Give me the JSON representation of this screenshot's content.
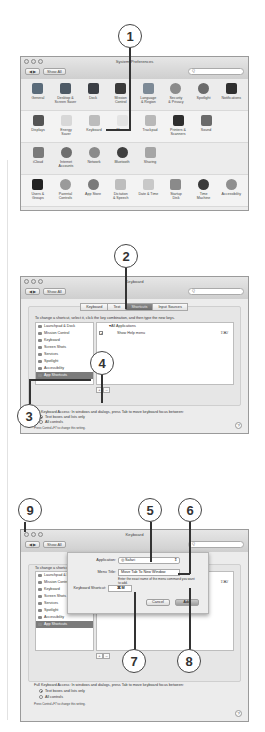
{
  "callouts": [
    "1",
    "2",
    "3",
    "4",
    "5",
    "6",
    "7",
    "8",
    "9"
  ],
  "system_prefs": {
    "title": "System Preferences",
    "show_all": "Show All",
    "nav_back": "◀",
    "nav_fwd": "▶",
    "search_placeholder": "Q",
    "rows": [
      [
        {
          "label": "General",
          "icon": "general-icon",
          "color": "#5a6b7a"
        },
        {
          "label": "Desktop &\nScreen Saver",
          "icon": "desktop-icon",
          "color": "#4e5a66"
        },
        {
          "label": "Dock",
          "icon": "dock-icon",
          "color": "#3b3f45"
        },
        {
          "label": "Mission\nControl",
          "icon": "mission-control-icon",
          "color": "#3a3a3a"
        },
        {
          "label": "Language\n& Region",
          "icon": "language-icon",
          "color": "#7d8a96"
        },
        {
          "label": "Security\n& Privacy",
          "icon": "security-icon",
          "color": "#8b8b8b"
        },
        {
          "label": "Spotlight",
          "icon": "spotlight-icon",
          "color": "#6a6a6a"
        },
        {
          "label": "Notifications",
          "icon": "notifications-icon",
          "color": "#2f2f2f"
        }
      ],
      [
        {
          "label": "Displays",
          "icon": "displays-icon",
          "color": "#555"
        },
        {
          "label": "Energy\nSaver",
          "icon": "energy-saver-icon",
          "color": "#d8d8d8"
        },
        {
          "label": "Keyboard",
          "icon": "keyboard-icon",
          "color": "#bcbcbc"
        },
        {
          "label": "Mouse",
          "icon": "mouse-icon",
          "color": "#e4e4e4"
        },
        {
          "label": "Trackpad",
          "icon": "trackpad-icon",
          "color": "#b8b8b8"
        },
        {
          "label": "Printers &\nScanners",
          "icon": "printer-icon",
          "color": "#2e2e2e"
        },
        {
          "label": "Sound",
          "icon": "sound-icon",
          "color": "#6a6a6a"
        }
      ],
      [
        {
          "label": "iCloud",
          "icon": "icloud-icon",
          "color": "#7a7a7a"
        },
        {
          "label": "Internet\nAccounts",
          "icon": "internet-accounts-icon",
          "color": "#6e6e6e"
        },
        {
          "label": "Network",
          "icon": "network-icon",
          "color": "#8a8a8a"
        },
        {
          "label": "Bluetooth",
          "icon": "bluetooth-icon",
          "color": "#3f3f3f"
        },
        {
          "label": "Sharing",
          "icon": "sharing-icon",
          "color": "#a5a5a5"
        }
      ],
      [
        {
          "label": "Users &\nGroups",
          "icon": "users-icon",
          "color": "#222"
        },
        {
          "label": "Parental\nControls",
          "icon": "parental-controls-icon",
          "color": "#9a9a9a"
        },
        {
          "label": "App Store",
          "icon": "app-store-icon",
          "color": "#7a7a7a"
        },
        {
          "label": "Dictation\n& Speech",
          "icon": "dictation-icon",
          "color": "#bdbdbd"
        },
        {
          "label": "Date & Time",
          "icon": "date-time-icon",
          "color": "#c8c8c8"
        },
        {
          "label": "Startup\nDisk",
          "icon": "startup-disk-icon",
          "color": "#8a8a8a"
        },
        {
          "label": "Time\nMachine",
          "icon": "time-machine-icon",
          "color": "#3a3a3a"
        },
        {
          "label": "Accessibility",
          "icon": "accessibility-icon",
          "color": "#8f8f8f"
        }
      ]
    ]
  },
  "keyboard": {
    "title": "Keyboard",
    "show_all": "Show All",
    "search_placeholder": "Q",
    "tabs": [
      "Keyboard",
      "Text",
      "Shortcuts",
      "Input Sources"
    ],
    "active_tab": "Shortcuts",
    "instructions": "To change a shortcut, select it, click the key combination, and then type the new keys.",
    "categories": [
      "Launchpad & Dock",
      "Mission Control",
      "Keyboard",
      "Screen Shots",
      "Services",
      "Spotlight",
      "Accessibility",
      "App Shortcuts"
    ],
    "selected_category": "App Shortcuts",
    "shortcuts_group": "▾All Applications",
    "shortcuts": [
      {
        "checked": true,
        "name": "Show Help menu",
        "keys": "⇧⌘/"
      }
    ],
    "add_label": "+",
    "remove_label": "–",
    "fka_text": "Full Keyboard Access: In windows and dialogs, press Tab to move keyboard focus between:",
    "radio_options": [
      "Text boxes and lists only",
      "All controls"
    ],
    "radio_selected": 0,
    "hint": "Press Control+F7 to change this setting.",
    "help": "?"
  },
  "sheet": {
    "application_label": "Application:",
    "application_value": "Safari",
    "menu_title_label": "Menu Title:",
    "menu_title_value": "Move Tab To New Window",
    "description": "Enter the exact name of the menu command you want to add.",
    "shortcut_label": "Keyboard Shortcut:",
    "shortcut_value": "⌘M",
    "cancel_label": "Cancel",
    "add_label": "Add"
  }
}
